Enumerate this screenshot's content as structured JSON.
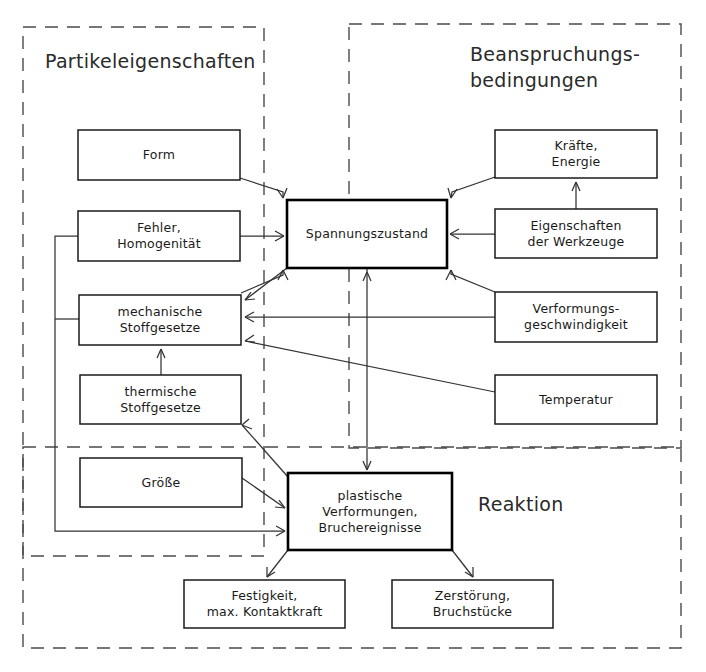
{
  "diagram": {
    "colors": {
      "background": "#ffffff",
      "node_stroke": "#1a1a1a",
      "emphasis_stroke": "#000000",
      "region_stroke": "#4a4a4a",
      "edge_stroke": "#333333",
      "text": "#1a1a1a"
    },
    "regions": [
      {
        "id": "partikeleigenschaften",
        "label": "Partikeleigenschaften",
        "label_x": 45,
        "label_y": 62,
        "x": 23,
        "y": 27,
        "w": 241,
        "h": 529
      },
      {
        "id": "beanspruchungsbedingungen",
        "label_line1": "Beanspruchungs-",
        "label_line2": "bedingungen",
        "label_x": 470,
        "label_y": 55,
        "x": 349,
        "y": 24,
        "w": 332,
        "h": 424
      },
      {
        "id": "reaktion",
        "label": "Reaktion",
        "label_x": 478,
        "label_y": 505,
        "x": 23,
        "y": 447,
        "w": 658,
        "h": 201
      }
    ],
    "nodes": [
      {
        "id": "form",
        "lines": [
          "Form"
        ],
        "x": 78,
        "y": 130,
        "w": 162,
        "h": 50,
        "emphasis": false
      },
      {
        "id": "fehler-homogenitaet",
        "lines": [
          "Fehler,",
          "Homogenität"
        ],
        "x": 78,
        "y": 211,
        "w": 162,
        "h": 50,
        "emphasis": false
      },
      {
        "id": "mechanische-stoffgesetze",
        "lines": [
          "mechanische",
          "Stoffgesetze"
        ],
        "x": 79,
        "y": 295,
        "w": 162,
        "h": 50,
        "emphasis": false
      },
      {
        "id": "thermische-stoffgesetze",
        "lines": [
          "thermische",
          "Stoffgesetze"
        ],
        "x": 80,
        "y": 375,
        "w": 161,
        "h": 49,
        "emphasis": false
      },
      {
        "id": "groesse",
        "lines": [
          "Größe"
        ],
        "x": 80,
        "y": 458,
        "w": 162,
        "h": 49,
        "emphasis": false
      },
      {
        "id": "spannungszustand",
        "lines": [
          "Spannungszustand"
        ],
        "x": 287,
        "y": 200,
        "w": 160,
        "h": 68,
        "emphasis": true
      },
      {
        "id": "kraefte-energie",
        "lines": [
          "Kräfte,",
          "Energie"
        ],
        "x": 495,
        "y": 130,
        "w": 162,
        "h": 48,
        "emphasis": false
      },
      {
        "id": "eigenschaften-der-werkzeuge",
        "lines": [
          "Eigenschaften",
          "der Werkzeuge"
        ],
        "x": 495,
        "y": 209,
        "w": 162,
        "h": 49,
        "emphasis": false
      },
      {
        "id": "verformungsgeschwindigkeit",
        "lines": [
          "Verformungs-",
          "geschwindigkeit"
        ],
        "x": 495,
        "y": 292,
        "w": 162,
        "h": 50,
        "emphasis": false
      },
      {
        "id": "temperatur",
        "lines": [
          "Temperatur"
        ],
        "x": 495,
        "y": 375,
        "w": 162,
        "h": 49,
        "emphasis": false
      },
      {
        "id": "plastische-verformungen",
        "lines": [
          "plastische",
          "Verformungen,",
          "Bruchereignisse"
        ],
        "x": 288,
        "y": 473,
        "w": 164,
        "h": 77,
        "emphasis": true
      },
      {
        "id": "festigkeit-kontaktkraft",
        "lines": [
          "Festigkeit,",
          "max. Kontaktkraft"
        ],
        "x": 184,
        "y": 580,
        "w": 161,
        "h": 48,
        "emphasis": false
      },
      {
        "id": "zerstoerung-bruchstuecke",
        "lines": [
          "Zerstörung,",
          "Bruchstücke"
        ],
        "x": 392,
        "y": 580,
        "w": 161,
        "h": 48,
        "emphasis": false
      }
    ],
    "edges": [
      {
        "id": "form-to-spannung",
        "from": "form",
        "to": "spannungszustand",
        "path": "M240 178 L283 192 L283 198",
        "arrow": "M283 198 L277 189 M283 198 L287 188"
      },
      {
        "id": "fehler-to-spannung",
        "from": "fehler-homogenitaet",
        "to": "spannungszustand",
        "path": "M240 236 L284 236",
        "arrow": "M284 236 L275 231 M284 236 L275 241"
      },
      {
        "id": "mech-to-spannung",
        "from": "mechanische-stoffgesetze",
        "to": "spannungszustand",
        "path": "M241 293 L283 275 L283 270",
        "arrow": "M283 270 L278 280 M283 270 L288 280"
      },
      {
        "id": "spannung-to-mech-feedback",
        "from": "spannungszustand",
        "to": "mechanische-stoffgesetze",
        "path": "M287 268 L245 300",
        "arrow": "M245 300 L255 299 M245 300 L251 292"
      },
      {
        "id": "kraefte-to-spannung",
        "from": "kraefte-energie",
        "to": "spannungszustand",
        "path": "M495 177 L452 192 L451 198",
        "arrow": "M451 198 L448 188 M451 198 L457 189"
      },
      {
        "id": "eigenschaften-to-spannung",
        "from": "eigenschaften-der-werkzeuge",
        "to": "spannungszustand",
        "path": "M495 234 L450 234",
        "arrow": "M450 234 L459 229 M450 234 L459 239"
      },
      {
        "id": "eigenschaften-to-kraefte",
        "from": "eigenschaften-der-werkzeuge",
        "to": "kraefte-energie",
        "path": "M576 209 L576 182",
        "arrow": "M576 182 L572 191 M576 182 L580 191"
      },
      {
        "id": "verformungsgeschw-to-spannung",
        "from": "verformungsgeschwindigkeit",
        "to": "spannungszustand",
        "path": "M495 292 L451 274 L451 270",
        "arrow": "M451 270 L446 280 M451 270 L456 280"
      },
      {
        "id": "verformungsgeschw-to-mech",
        "from": "verformungsgeschwindigkeit",
        "to": "mechanische-stoffgesetze",
        "path": "M495 317 L245 317",
        "arrow": "M245 317 L254 312 M245 317 L254 322"
      },
      {
        "id": "temperatur-to-mech",
        "from": "temperatur",
        "to": "mechanische-stoffgesetze",
        "path": "M495 392 L245 341",
        "arrow": "M245 341 L255 342 M245 341 L254 335"
      },
      {
        "id": "thermische-to-mech",
        "from": "thermische-stoffgesetze",
        "to": "mechanische-stoffgesetze",
        "path": "M161 375 L161 349",
        "arrow": "M161 349 L157 358 M161 349 L165 358"
      },
      {
        "id": "spannung-plastische-bidirectional",
        "from": "spannungszustand",
        "to": "plastische-verformungen",
        "path": "M367 268 L367 470",
        "arrow": "M367 272 L363 281 M367 272 L371 281 M367 470 L363 461 M367 470 L371 461"
      },
      {
        "id": "groesse-to-plastische",
        "from": "groesse",
        "to": "plastische-verformungen",
        "path": "M242 478 L285 508",
        "arrow": "M285 508 L275 507 M285 508 L279 500"
      },
      {
        "id": "plastische-to-thermische",
        "from": "plastische-verformungen",
        "to": "thermische-stoffgesetze",
        "path": "M288 477 L242 425",
        "arrow": "M242 425 L252 429 M242 425 L249 419"
      },
      {
        "id": "plastische-feedback-loop",
        "from": "plastische-verformungen",
        "to": "left-column",
        "path": "M285 531 L55 531 L55 236 L84 236",
        "arrow": "M285 531 L276 526 M285 531 L276 536 M84 236 L93 231 M84 236 L93 241"
      },
      {
        "id": "feedback-to-mech",
        "from": "feedback-line",
        "to": "mechanische-stoffgesetze",
        "path": "M55 319 L84 319",
        "arrow": "M84 319 L93 314 M84 319 L93 324"
      },
      {
        "id": "plastische-to-festigkeit",
        "from": "plastische-verformungen",
        "to": "festigkeit-kontaktkraft",
        "path": "M288 550 L267 577",
        "arrow": "M267 577 L267 567 M267 577 L275 572"
      },
      {
        "id": "plastische-to-zerstoerung",
        "from": "plastische-verformungen",
        "to": "zerstoerung-bruchstuecke",
        "path": "M452 550 L473 577",
        "arrow": "M473 577 L465 572 M473 577 L473 567"
      }
    ]
  }
}
